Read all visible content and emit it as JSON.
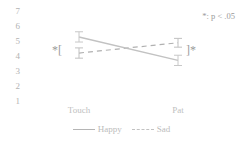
{
  "chart_data": {
    "type": "line",
    "title": "",
    "xlabel": "",
    "ylabel": "",
    "categories": [
      "Touch",
      "Pat"
    ],
    "ylim": [
      1,
      7
    ],
    "yticks": [
      7,
      6,
      5,
      4,
      3,
      2,
      1
    ],
    "grid": false,
    "legend_position": "bottom-center",
    "series": [
      {
        "name": "Happy",
        "style": "solid",
        "color": "#b0b0b0",
        "values": [
          4.1,
          4.8
        ],
        "errors": [
          0.35,
          0.3
        ]
      },
      {
        "name": "Sad",
        "style": "dashed",
        "color": "#c2c2c2",
        "values": [
          5.2,
          3.6
        ],
        "errors": [
          0.35,
          0.35
        ]
      }
    ],
    "annotations": [
      {
        "name": "significance-note",
        "text": "*: p < .05"
      },
      {
        "name": "bracket-left",
        "text": "*["
      },
      {
        "name": "bracket-right",
        "text": "]*"
      }
    ]
  },
  "axis": {
    "ytick_labels": [
      "7",
      "6",
      "5",
      "4",
      "3",
      "2",
      "1"
    ],
    "xtick_labels": [
      "Touch",
      "Pat"
    ]
  },
  "legend": {
    "items": [
      {
        "label": "Happy"
      },
      {
        "label": "Sad"
      }
    ]
  },
  "notes": {
    "significance": "*: p < .05",
    "bracket_left": "*[",
    "bracket_right": "]*"
  },
  "colors": {
    "happy_line": "#b0b0b0",
    "sad_line": "#c2c2c2",
    "text": "#b8b8b8",
    "background": "#ffffff"
  }
}
